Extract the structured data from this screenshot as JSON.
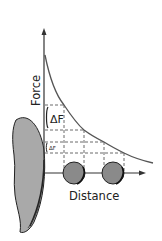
{
  "diagram": {
    "y_axis_label": "Force",
    "x_axis_label": "Distance",
    "delta_labels": [
      "ΔF",
      "ΔF"
    ],
    "colors": {
      "line": "#333333",
      "curve": "#555555",
      "body_fill": "#a9a9a9",
      "ball_fill": "#8a8a8a",
      "dash": "#444444",
      "background": "#ffffff"
    },
    "elements": [
      {
        "name": "large body",
        "shape": "half-ellipse, left"
      },
      {
        "name": "ball 1",
        "shape": "circle"
      },
      {
        "name": "ball 2",
        "shape": "circle"
      },
      {
        "name": "force curve",
        "shape": "decaying curve"
      }
    ]
  }
}
